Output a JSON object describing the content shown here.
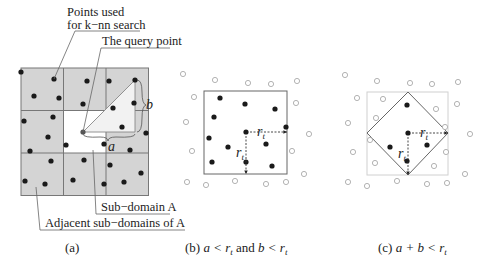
{
  "panel_a": {
    "label_points": [
      "Points used",
      "for k−nn search"
    ],
    "label_query": "The query point",
    "label_subdomain": "Sub−domain A",
    "label_adjacent": "Adjacent sub−domains of A",
    "var_a": "a",
    "var_b": "b",
    "caption": "(a)",
    "grid": {
      "x0": 21,
      "y0": 68,
      "cell": 42.5,
      "rows": 3,
      "cols": 3,
      "fill": "#d4d4d4",
      "center_fill": "#ffffff",
      "line": "#777777"
    },
    "points": [
      [
        21,
        72
      ],
      [
        54,
        79
      ],
      [
        34,
        96
      ],
      [
        59,
        98
      ],
      [
        87,
        81
      ],
      [
        109,
        81
      ],
      [
        135,
        80
      ],
      [
        83,
        104
      ],
      [
        113,
        108
      ],
      [
        134,
        103
      ],
      [
        24,
        121
      ],
      [
        53,
        117
      ],
      [
        48,
        137
      ],
      [
        122,
        127
      ],
      [
        146,
        133
      ],
      [
        66,
        145
      ],
      [
        104,
        144
      ],
      [
        30,
        151
      ],
      [
        130,
        150
      ],
      [
        51,
        161
      ],
      [
        84,
        160
      ],
      [
        110,
        165
      ],
      [
        141,
        173
      ],
      [
        25,
        181
      ],
      [
        45,
        184
      ],
      [
        73,
        180
      ],
      [
        104,
        184
      ],
      [
        124,
        182
      ]
    ],
    "query_point": [
      83,
      132
    ]
  },
  "panel_b": {
    "caption_prefix": "(b) ",
    "caption_math1": "a < r",
    "caption_sub": "t",
    "caption_and": " and ",
    "caption_math2": "b < r",
    "caption_sub2": "t",
    "r_label": "r",
    "r_sub": "t",
    "box": {
      "x": 204,
      "y": 91,
      "w": 83,
      "h": 83
    },
    "center": [
      246,
      132
    ],
    "filled_points": [
      [
        220,
        98
      ],
      [
        245,
        104
      ],
      [
        275,
        109
      ],
      [
        214,
        117
      ],
      [
        209,
        138
      ],
      [
        228,
        147
      ],
      [
        266,
        144
      ],
      [
        212,
        162
      ],
      [
        246,
        162
      ],
      [
        272,
        166
      ],
      [
        286,
        127
      ]
    ],
    "hollow_points": [
      [
        183,
        74
      ],
      [
        215,
        80
      ],
      [
        248,
        83
      ],
      [
        271,
        84
      ],
      [
        297,
        81
      ],
      [
        194,
        97
      ],
      [
        296,
        103
      ],
      [
        186,
        122
      ],
      [
        309,
        134
      ],
      [
        192,
        151
      ],
      [
        292,
        151
      ],
      [
        187,
        182
      ],
      [
        206,
        185
      ],
      [
        235,
        181
      ],
      [
        266,
        184
      ],
      [
        286,
        182
      ],
      [
        304,
        174
      ]
    ]
  },
  "panel_c": {
    "caption_prefix": "(c) ",
    "caption_math": "a + b < r",
    "caption_sub": "t",
    "r_label": "r",
    "r_sub": "t",
    "square": {
      "x": 367,
      "y": 92,
      "w": 81,
      "h": 83
    },
    "center": [
      408,
      133
    ],
    "filled_points": [
      [
        407,
        105
      ],
      [
        390,
        147
      ],
      [
        427,
        145
      ],
      [
        407,
        161
      ]
    ],
    "hollow_points": [
      [
        345,
        75
      ],
      [
        377,
        81
      ],
      [
        410,
        83
      ],
      [
        432,
        84
      ],
      [
        458,
        82
      ],
      [
        357,
        98
      ],
      [
        383,
        99
      ],
      [
        436,
        109
      ],
      [
        457,
        104
      ],
      [
        376,
        118
      ],
      [
        348,
        123
      ],
      [
        370,
        140
      ],
      [
        445,
        127
      ],
      [
        470,
        134
      ],
      [
        353,
        152
      ],
      [
        446,
        152
      ],
      [
        375,
        163
      ],
      [
        434,
        166
      ],
      [
        348,
        182
      ],
      [
        367,
        186
      ],
      [
        397,
        181
      ],
      [
        427,
        184
      ],
      [
        447,
        183
      ],
      [
        465,
        174
      ]
    ]
  }
}
